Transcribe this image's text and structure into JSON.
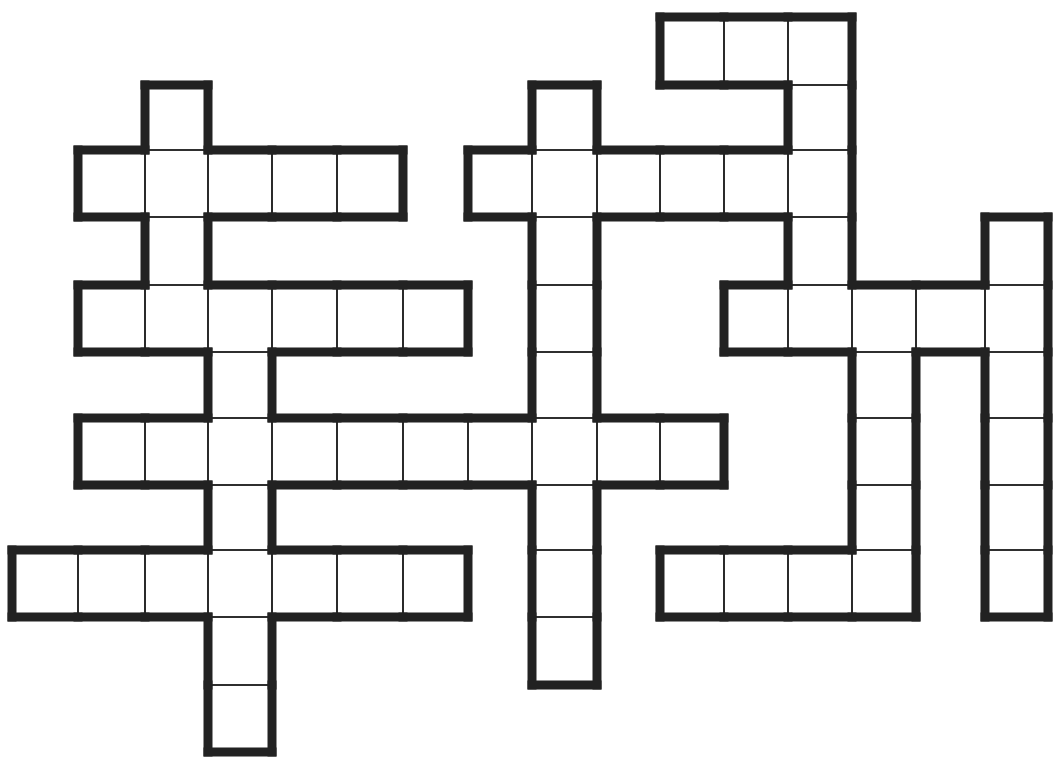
{
  "puzzle": {
    "type": "crossword",
    "colors": {
      "background": "#ffffff",
      "line": "#222222"
    },
    "grid": {
      "col_x": [
        12,
        78,
        145,
        208,
        272,
        337,
        403,
        468,
        532,
        597,
        660,
        724,
        788,
        852,
        916,
        985,
        1048
      ],
      "row_y": [
        17,
        85,
        150,
        217,
        285,
        352,
        418,
        485,
        550,
        617,
        685,
        752
      ]
    },
    "cells": [
      [
        0,
        10
      ],
      [
        0,
        11
      ],
      [
        0,
        12
      ],
      [
        1,
        2
      ],
      [
        1,
        8
      ],
      [
        1,
        12
      ],
      [
        2,
        1
      ],
      [
        2,
        2
      ],
      [
        2,
        3
      ],
      [
        2,
        4
      ],
      [
        2,
        5
      ],
      [
        2,
        7
      ],
      [
        2,
        8
      ],
      [
        2,
        9
      ],
      [
        2,
        10
      ],
      [
        2,
        11
      ],
      [
        2,
        12
      ],
      [
        3,
        2
      ],
      [
        3,
        8
      ],
      [
        3,
        12
      ],
      [
        3,
        15
      ],
      [
        4,
        1
      ],
      [
        4,
        2
      ],
      [
        4,
        3
      ],
      [
        4,
        4
      ],
      [
        4,
        5
      ],
      [
        4,
        6
      ],
      [
        4,
        8
      ],
      [
        4,
        11
      ],
      [
        4,
        12
      ],
      [
        4,
        13
      ],
      [
        4,
        14
      ],
      [
        4,
        15
      ],
      [
        5,
        3
      ],
      [
        5,
        8
      ],
      [
        5,
        13
      ],
      [
        5,
        15
      ],
      [
        6,
        1
      ],
      [
        6,
        2
      ],
      [
        6,
        3
      ],
      [
        6,
        4
      ],
      [
        6,
        5
      ],
      [
        6,
        6
      ],
      [
        6,
        7
      ],
      [
        6,
        8
      ],
      [
        6,
        9
      ],
      [
        6,
        10
      ],
      [
        6,
        13
      ],
      [
        6,
        15
      ],
      [
        7,
        3
      ],
      [
        7,
        8
      ],
      [
        7,
        13
      ],
      [
        7,
        15
      ],
      [
        8,
        0
      ],
      [
        8,
        1
      ],
      [
        8,
        2
      ],
      [
        8,
        3
      ],
      [
        8,
        4
      ],
      [
        8,
        5
      ],
      [
        8,
        6
      ],
      [
        8,
        8
      ],
      [
        8,
        10
      ],
      [
        8,
        11
      ],
      [
        8,
        12
      ],
      [
        8,
        13
      ],
      [
        8,
        15
      ],
      [
        9,
        3
      ],
      [
        9,
        8
      ],
      [
        10,
        3
      ]
    ]
  }
}
